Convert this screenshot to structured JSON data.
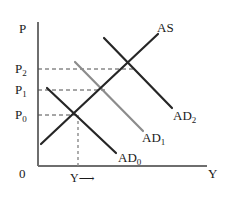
{
  "figure": {
    "type": "ad-as-diagram",
    "title_text": "",
    "axes": {
      "y_axis_label": "P",
      "x_axis_label": "Y",
      "origin_label": "0",
      "x_axis_inner_label": "Y",
      "x_axis_inner_arrow": "⟶"
    },
    "price_ticks": [
      {
        "base": "P",
        "sub": "2"
      },
      {
        "base": "P",
        "sub": "1"
      },
      {
        "base": "P",
        "sub": "0"
      }
    ],
    "curves": [
      {
        "name": "as",
        "base": "AS",
        "sub": "",
        "color": "#262626"
      },
      {
        "name": "ad2",
        "base": "AD",
        "sub": "2",
        "color": "#262626"
      },
      {
        "name": "ad1",
        "base": "AD",
        "sub": "1",
        "color": "#8c8c8c"
      },
      {
        "name": "ad0",
        "base": "AD",
        "sub": "0",
        "color": "#262626"
      }
    ],
    "colors": {
      "axis": "#6e6e6e",
      "curve_dark": "#262626",
      "curve_light": "#8c8c8c",
      "guide": "#4d4d4d",
      "background": "#ffffff"
    },
    "geometry": {
      "y_axis_x": 38,
      "x_axis_y": 166,
      "y_axis_top": 22,
      "x_axis_right": 207,
      "p2_y": 69,
      "p1_y": 90,
      "p0_y": 115,
      "eq0_x": 78,
      "eq1_x": 105,
      "eq2_x": 133,
      "as_from": [
        41,
        144
      ],
      "as_to": [
        158,
        34
      ],
      "ad0_from": [
        47,
        88
      ],
      "ad0_to": [
        116,
        153
      ],
      "ad1_from": [
        75,
        62
      ],
      "ad1_to": [
        143,
        131
      ],
      "ad2_from": [
        104,
        38
      ],
      "ad2_to": [
        172,
        108
      ]
    }
  }
}
